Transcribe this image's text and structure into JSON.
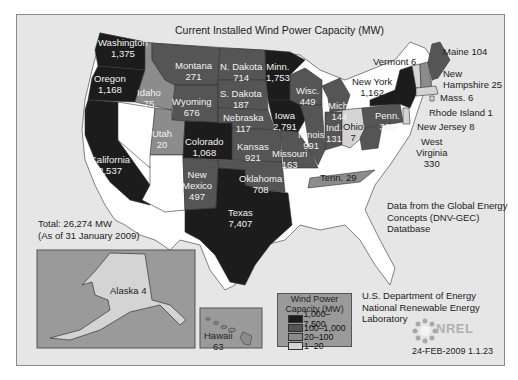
{
  "title": "Current Installed Wind Power Capacity (MW)",
  "total": {
    "line1": "Total: 26,274 MW",
    "line2": "(As of 31 January 2009)"
  },
  "source": {
    "line1": "Data from the Global Energy",
    "line2": "Concepts (DNV-GEC)",
    "line3": "Datatbase"
  },
  "credit": {
    "line1": "U.S. Department of Energy",
    "line2": "National Renewable Energy",
    "line3": "Laboratory"
  },
  "logo": "NREL",
  "stamp": "24-FEB-2009 1.1.23",
  "legend": {
    "title1": "Wind Power",
    "title2": "Capacity (MW)",
    "items": [
      {
        "range": "1,000–7,500",
        "color": "#1c1c1c"
      },
      {
        "range": "100–1,000",
        "color": "#555555"
      },
      {
        "range": "20–100",
        "color": "#8c8c8c"
      },
      {
        "range": "1–20",
        "color": "#d4d4d4"
      }
    ]
  },
  "colors": {
    "frame_bg": "#e6e6e6",
    "no_data": "#ffffff",
    "tier1": "#1c1c1c",
    "tier2": "#555555",
    "tier3": "#8c8c8c",
    "tier4": "#d4d4d4"
  },
  "states": {
    "washington": {
      "name": "Washington",
      "value": "1,375"
    },
    "oregon": {
      "name": "Oregon",
      "value": "1,168"
    },
    "california": {
      "name": "California",
      "value": "2,537"
    },
    "idaho": {
      "name": "Idaho",
      "value": "75"
    },
    "montana": {
      "name": "Montana",
      "value": "271"
    },
    "wyoming": {
      "name": "Wyoming",
      "value": "676"
    },
    "utah": {
      "name": "Utah",
      "value": "20"
    },
    "colorado": {
      "name": "Colorado",
      "value": "1,068"
    },
    "new_mexico": {
      "name1": "New",
      "name2": "Mexico",
      "value": "497"
    },
    "n_dakota": {
      "name": "N. Dakota",
      "value": "714"
    },
    "s_dakota": {
      "name": "S. Dakota",
      "value": "187"
    },
    "nebraska": {
      "name": "Nebraska",
      "value": "117"
    },
    "kansas": {
      "name": "Kansas",
      "value": "921"
    },
    "oklahoma": {
      "name": "Oklahoma",
      "value": "708"
    },
    "texas": {
      "name": "Texas",
      "value": "7,407"
    },
    "minnesota": {
      "name": "Minn.",
      "value": "1,753"
    },
    "iowa": {
      "name": "Iowa",
      "value": "2,791"
    },
    "missouri": {
      "name": "Missouri",
      "value": "163"
    },
    "wisconsin": {
      "name": "Wisc.",
      "value": "449"
    },
    "illinois": {
      "name": "Illinois",
      "value": "991"
    },
    "michigan": {
      "name": "Mich.",
      "value": "144"
    },
    "indiana": {
      "name": "Ind.",
      "value": "131"
    },
    "ohio": {
      "name": "Ohio",
      "value": "7"
    },
    "tennessee": {
      "label": "Tenn. 29"
    },
    "pennsylvania": {
      "name": "Penn.",
      "value": "366"
    },
    "new_york": {
      "name": "New York",
      "value": "1,162"
    },
    "vermont": {
      "label": "Vermont 6"
    },
    "maine": {
      "label": "Maine 104"
    },
    "new_hampshire": {
      "name1": "New",
      "name2": "Hampshire 25"
    },
    "massachusetts": {
      "label": "Mass. 6"
    },
    "rhode_island": {
      "label": "Rhode Island 1"
    },
    "new_jersey": {
      "label": "New Jersey 8"
    },
    "west_virginia": {
      "name1": "West",
      "name2": "Virginia",
      "value": "330"
    },
    "alaska": {
      "label": "Alaska 4"
    },
    "hawaii": {
      "name": "Hawaii",
      "value": "63"
    }
  }
}
